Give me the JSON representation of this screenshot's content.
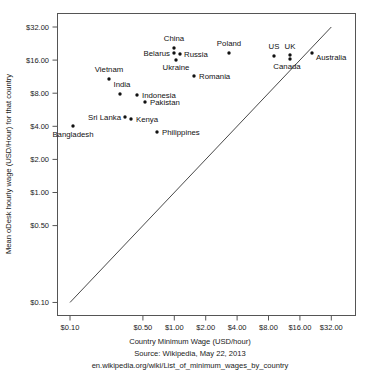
{
  "chart_data": {
    "type": "scatter",
    "title": "",
    "xlabel": "Country Minimum Wage (USD/hour)",
    "ylabel": "Mean oDesk hourly wage (USD/Hour) for that country",
    "xscale": "log",
    "yscale": "log",
    "xlim": [
      0.085,
      42.0
    ],
    "ylim": [
      0.085,
      42.0
    ],
    "grid": false,
    "legend": null,
    "xticks": [
      "$0.10",
      "$0.50",
      "$1.00",
      "$2.00",
      "$4.00",
      "$8.00",
      "$16.00",
      "$32.00"
    ],
    "xtick_values": [
      0.1,
      0.5,
      1.0,
      2.0,
      4.0,
      8.0,
      16.0,
      32.0
    ],
    "yticks": [
      "$32.00",
      "$16.00",
      "$8.00",
      "$4.00",
      "$2.00",
      "$1.00",
      "$0.50",
      "$0.10"
    ],
    "ytick_values": [
      32.0,
      16.0,
      8.0,
      4.0,
      2.0,
      1.0,
      0.5,
      0.1
    ],
    "reference_line": {
      "label": "y = x identity line",
      "from": [
        0.1,
        0.1
      ],
      "to": [
        32.0,
        32.0
      ]
    },
    "points": [
      {
        "label": "China",
        "x": 0.8,
        "y": 21.0,
        "px": 174,
        "py": 48,
        "lx": 174,
        "ly": 41,
        "anchor": "middle"
      },
      {
        "label": "Belarus",
        "x": 0.8,
        "y": 17.5,
        "px": 174,
        "py": 53,
        "lx": 170,
        "ly": 56,
        "anchor": "end"
      },
      {
        "label": "Russia",
        "x": 0.93,
        "y": 17.0,
        "px": 180,
        "py": 54,
        "lx": 184,
        "ly": 57,
        "anchor": "start"
      },
      {
        "label": "Ukraine",
        "x": 0.84,
        "y": 14.5,
        "px": 176,
        "py": 60,
        "lx": 176,
        "ly": 70,
        "anchor": "middle"
      },
      {
        "label": "Poland",
        "x": 2.9,
        "y": 18.0,
        "px": 229,
        "py": 53,
        "lx": 229,
        "ly": 46,
        "anchor": "middle"
      },
      {
        "label": "Romania",
        "x": 1.4,
        "y": 11.5,
        "px": 194,
        "py": 76,
        "lx": 199,
        "ly": 79,
        "anchor": "start"
      },
      {
        "label": "US",
        "x": 7.25,
        "y": 16.2,
        "px": 274,
        "py": 56,
        "lx": 274,
        "ly": 49,
        "anchor": "middle"
      },
      {
        "label": "UK",
        "x": 9.5,
        "y": 16.2,
        "px": 290,
        "py": 55,
        "lx": 290,
        "ly": 49,
        "anchor": "middle"
      },
      {
        "label": "Canada",
        "x": 9.5,
        "y": 14.8,
        "px": 290,
        "py": 59,
        "lx": 287,
        "ly": 69,
        "anchor": "middle"
      },
      {
        "label": "Australia",
        "x": 15.96,
        "y": 17.5,
        "px": 312,
        "py": 53,
        "lx": 316,
        "ly": 60,
        "anchor": "start"
      },
      {
        "label": "Vietnam",
        "x": 0.2,
        "y": 11.0,
        "px": 109,
        "py": 79,
        "lx": 109,
        "ly": 72,
        "anchor": "middle"
      },
      {
        "label": "India",
        "x": 0.28,
        "y": 8.4,
        "px": 120,
        "py": 94,
        "lx": 122,
        "ly": 87,
        "anchor": "middle"
      },
      {
        "label": "Indonesia",
        "x": 0.4,
        "y": 8.0,
        "px": 137,
        "py": 95,
        "lx": 142,
        "ly": 98,
        "anchor": "start"
      },
      {
        "label": "Pakistan",
        "x": 0.5,
        "y": 6.8,
        "px": 145,
        "py": 102,
        "lx": 150,
        "ly": 105,
        "anchor": "start"
      },
      {
        "label": "Sri Lanka",
        "x": 0.31,
        "y": 5.0,
        "px": 125,
        "py": 117,
        "lx": 121,
        "ly": 120,
        "anchor": "end"
      },
      {
        "label": "Kenya",
        "x": 0.36,
        "y": 4.7,
        "px": 131,
        "py": 119,
        "lx": 136,
        "ly": 122,
        "anchor": "start"
      },
      {
        "label": "Bangladesh",
        "x": 0.11,
        "y": 4.0,
        "px": 73,
        "py": 126,
        "lx": 73,
        "ly": 137,
        "anchor": "middle"
      },
      {
        "label": "Philippines",
        "x": 0.62,
        "y": 3.6,
        "px": 157,
        "py": 132,
        "lx": 162,
        "ly": 135,
        "anchor": "start"
      }
    ]
  },
  "caption": {
    "line1": "Country Minimum Wage (USD/hour)",
    "line2": "Source: Wikipedia, May 22, 2013",
    "line3": "en.wikipedia.org/wiki/List_of_minimum_wages_by_country"
  },
  "colors": {
    "marker": "#111111",
    "axis": "#555555",
    "text": "#1a1a1a",
    "background": "#ffffff"
  }
}
